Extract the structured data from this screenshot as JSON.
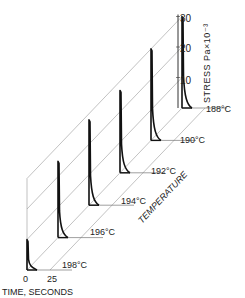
{
  "chart_data": {
    "type": "line",
    "subtype": "3d-waterfall",
    "title": "",
    "xlabel": "TIME, SECONDS",
    "ylabel": "STRESS Pa×10⁻³",
    "zlabel": "TEMPERATURE",
    "x_ticks": [
      "0",
      "25"
    ],
    "xlim": [
      0,
      25
    ],
    "y_ticks": [
      "10",
      "20",
      "30"
    ],
    "ylim": [
      0,
      30
    ],
    "series": [
      {
        "name": "188°C",
        "peak_stress": 30,
        "decay": "sharp peak near t=0, rapid decay"
      },
      {
        "name": "190°C",
        "peak_stress": 30,
        "decay": "sharp peak near t=0, rapid decay"
      },
      {
        "name": "192°C",
        "peak_stress": 27,
        "decay": "sharp peak near t=0, rapid decay"
      },
      {
        "name": "194°C",
        "peak_stress": 28,
        "decay": "sharp peak near t=0, rapid decay"
      },
      {
        "name": "196°C",
        "peak_stress": 25,
        "decay": "sharp peak near t=0, rapid decay"
      },
      {
        "name": "198°C",
        "peak_stress": 10,
        "decay": "sharp peak near t=0, rapid decay"
      }
    ],
    "grid": true,
    "legend": "none"
  },
  "labels": {
    "time_axis": "TIME, SECONDS",
    "stress_axis": "STRESS  Pa×10⁻³",
    "temperature_axis": "TEMPERATURE",
    "tick_0": "0",
    "tick_25": "25",
    "tick_10": "10",
    "tick_20": "20",
    "tick_30": "30",
    "temps": [
      "188°C",
      "190°C",
      "192°C",
      "194°C",
      "196°C",
      "198°C"
    ]
  }
}
